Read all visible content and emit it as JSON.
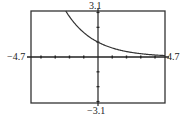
{
  "chart_data": {
    "type": "line",
    "title": "",
    "xlabel": "",
    "ylabel": "",
    "xlim": [
      -4.7,
      4.7
    ],
    "ylim": [
      -3.1,
      3.1
    ],
    "grid": false,
    "legend": null,
    "window_labels": {
      "xmin": "−4.7",
      "xmax": "4.7",
      "ymin": "−3.1",
      "ymax": "3.1"
    },
    "x_ticks": [
      -4,
      -3,
      -2,
      -1,
      1,
      2,
      3,
      4
    ],
    "y_ticks": [
      -3,
      -2,
      -1,
      1,
      2,
      3
    ],
    "series": [
      {
        "name": "f(x)",
        "function": "exponential decay, approx y = e^(-x/2)",
        "x": [
          -2.3,
          -2,
          -1.5,
          -1,
          -0.5,
          0,
          0.5,
          1,
          1.5,
          2,
          2.5,
          3,
          3.5,
          4,
          4.5,
          4.7
        ],
        "y": [
          3.16,
          2.72,
          2.12,
          1.65,
          1.28,
          1.0,
          0.78,
          0.61,
          0.47,
          0.37,
          0.29,
          0.22,
          0.17,
          0.14,
          0.11,
          0.1
        ]
      }
    ],
    "colors": {
      "curve": "#333333",
      "axes": "#222222",
      "frame": "#333333",
      "background": "#ffffff"
    }
  }
}
